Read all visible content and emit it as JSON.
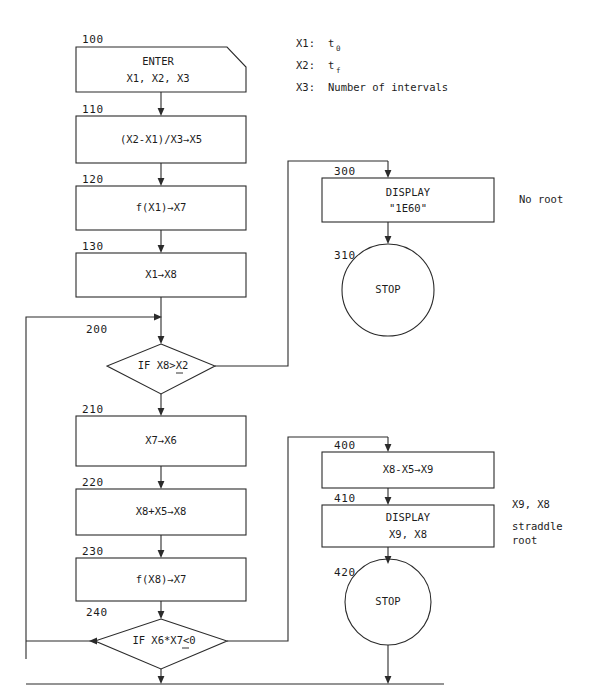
{
  "diagram": {
    "stroke_color": "#2b2b2b",
    "text_color": "#1c1c1c",
    "background": "#ffffff"
  },
  "legend": [
    {
      "key": "X1:",
      "value": "t",
      "sub": "0"
    },
    {
      "key": "X2:",
      "value": "t",
      "sub": "f"
    },
    {
      "key": "X3:",
      "value": "Number of intervals",
      "sub": ""
    }
  ],
  "nodes": {
    "n100": {
      "step": "100",
      "shape": "input-parallelogram",
      "line1": "ENTER",
      "line2": "X1, X2, X3"
    },
    "n110": {
      "step": "110",
      "shape": "process",
      "line1": "(X2-X1)/X3→X5",
      "line2": ""
    },
    "n120": {
      "step": "120",
      "shape": "process",
      "line1": "f(X1)→X7",
      "line2": ""
    },
    "n130": {
      "step": "130",
      "shape": "process",
      "line1": "X1→X8",
      "line2": ""
    },
    "n200": {
      "step": "200",
      "shape": "decision",
      "line1": "IF  X8>X2",
      "line2": "",
      "comparator": "greater-or-equal"
    },
    "n210": {
      "step": "210",
      "shape": "process",
      "line1": "X7→X6",
      "line2": ""
    },
    "n220": {
      "step": "220",
      "shape": "process",
      "line1": "X8+X5→X8",
      "line2": ""
    },
    "n230": {
      "step": "230",
      "shape": "process",
      "line1": "f(X8)→X7",
      "line2": ""
    },
    "n240": {
      "step": "240",
      "shape": "decision",
      "line1": "IF  X6*X7<0",
      "line2": "",
      "comparator": "less-or-equal"
    },
    "n300": {
      "step": "300",
      "shape": "process",
      "line1": "DISPLAY",
      "line2": "\"1E60\""
    },
    "n310": {
      "step": "310",
      "shape": "terminator-circle",
      "line1": "STOP",
      "line2": ""
    },
    "n400": {
      "step": "400",
      "shape": "process",
      "line1": "X8-X5→X9",
      "line2": ""
    },
    "n410": {
      "step": "410",
      "shape": "process",
      "line1": "DISPLAY",
      "line2": "X9, X8"
    },
    "n420": {
      "step": "420",
      "shape": "terminator-circle",
      "line1": "STOP",
      "line2": ""
    }
  },
  "annotations": {
    "no_root": "No root",
    "straddle_1": "X9, X8",
    "straddle_2": "straddle",
    "straddle_3": "root"
  }
}
